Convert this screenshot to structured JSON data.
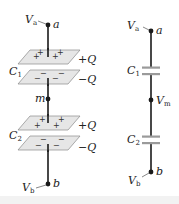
{
  "colors": {
    "wire": "#1a1a1a",
    "plate_fill": "#e6e6e6",
    "plate_stroke": "#8a8a8a",
    "cap_symbol": "#9a9a9a",
    "background": "#ffffff"
  },
  "left_diagram": {
    "node_a": {
      "potential": "V",
      "potential_sub": "a",
      "name": "a"
    },
    "capacitor_1": {
      "name": "C",
      "sub": "1",
      "top_charge": "+Q",
      "bottom_charge": "−Q",
      "top_signs": [
        "+",
        "+",
        "+",
        "+"
      ],
      "bottom_signs": [
        "−",
        "−",
        "−",
        "−"
      ]
    },
    "node_m": {
      "name": "m"
    },
    "capacitor_2": {
      "name": "C",
      "sub": "2",
      "top_charge": "+Q",
      "bottom_charge": "−Q",
      "top_signs": [
        "+",
        "+",
        "+",
        "+"
      ],
      "bottom_signs": [
        "−",
        "−",
        "−",
        "−"
      ]
    },
    "node_b": {
      "potential": "V",
      "potential_sub": "b",
      "name": "b"
    }
  },
  "right_diagram": {
    "node_a": {
      "potential": "V",
      "potential_sub": "a",
      "name": "a"
    },
    "capacitor_1": {
      "name": "C",
      "sub": "1"
    },
    "node_m": {
      "potential": "V",
      "potential_sub": "m"
    },
    "capacitor_2": {
      "name": "C",
      "sub": "2"
    },
    "node_b": {
      "potential": "V",
      "potential_sub": "b",
      "name": "b"
    }
  }
}
